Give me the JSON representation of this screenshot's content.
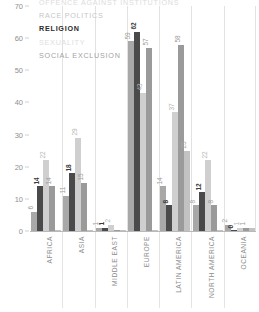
{
  "chart_data": {
    "type": "bar",
    "title": "",
    "subtitle": "",
    "xlabel": "",
    "ylabel": "",
    "ylim": [
      0,
      70
    ],
    "yticks": [
      0,
      10,
      20,
      30,
      40,
      50,
      60,
      70
    ],
    "grid": false,
    "legend_position": "top-left",
    "categories": [
      "AFRICA",
      "ASIA",
      "MIDDLE EAST",
      "EUROPE",
      "LATIN AMERICA",
      "NORTH AMERICA",
      "OCEANIA"
    ],
    "series": [
      {
        "name": "OFFENCE AGAINST INSTITUTIONS",
        "color": "#a8a8a8",
        "label_color": "#9c9c9c",
        "values": [
          6,
          11,
          1,
          59,
          14,
          8,
          2
        ],
        "value_labels": [
          "6",
          "11",
          "1",
          "59",
          "14",
          "8",
          "2"
        ]
      },
      {
        "name": "RACE POLITICS",
        "color": "#4a4a4a",
        "label_color": "#3a3a3a",
        "values": [
          14,
          18,
          1,
          62,
          8,
          12,
          0
        ],
        "value_labels": [
          "14",
          "18",
          "1",
          "62",
          "8",
          "12",
          "0"
        ]
      },
      {
        "name": "RELIGION",
        "color": "#cfcfcf",
        "label_color": "#b4b4b4",
        "values": [
          22,
          29,
          2,
          43,
          37,
          22,
          1
        ],
        "value_labels": [
          "22",
          "29",
          "2",
          "43",
          "37",
          "22",
          "1"
        ]
      },
      {
        "name": "SEXUALITY",
        "color": "#9a9a9a",
        "label_color": "#989898",
        "values": [
          14,
          15,
          0,
          57,
          58,
          8,
          1
        ],
        "value_labels": [
          "14",
          "15",
          "",
          "57",
          "58",
          "8",
          "1"
        ]
      },
      {
        "name": "SOCIAL EXCLUSION",
        "color": "#c2c2c2",
        "label_color": "#a6a6a6",
        "values": [
          0,
          0,
          0,
          0,
          25,
          0,
          1
        ],
        "value_labels": [
          "",
          "",
          "",
          "",
          "25",
          "",
          ""
        ]
      }
    ]
  },
  "legend": {
    "items": [
      {
        "label": "OFFENCE AGAINST INSTITUTIONS",
        "color": "#dcdcdc",
        "weight": "normal"
      },
      {
        "label": "RACE POLITICS",
        "color": "#c6c6c6",
        "weight": "normal"
      },
      {
        "label": "RELIGION",
        "color": "#2b2b2b",
        "weight": "bold"
      },
      {
        "label": "SEXUALITY",
        "color": "#dedede",
        "weight": "normal"
      },
      {
        "label": "SOCIAL EXCLUSION",
        "color": "#a3a3a3",
        "weight": "normal"
      }
    ]
  },
  "axis": {
    "y_tick_labels": [
      "70",
      "60",
      "50",
      "40",
      "30",
      "20",
      "10",
      "0"
    ]
  }
}
